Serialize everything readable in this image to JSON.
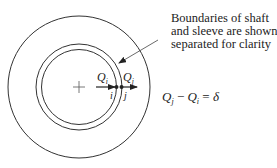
{
  "diagram": {
    "annotation": {
      "lines": [
        "Boundaries of shaft",
        "and sleeve are shown",
        "separated for clarity"
      ]
    },
    "labels": {
      "flow_in": {
        "symbol": "Q",
        "subscript": "i"
      },
      "flow_out": {
        "symbol": "Q",
        "subscript": "j"
      },
      "node_i": "i",
      "node_j": "j"
    },
    "equation": {
      "lhs_a_symbol": "Q",
      "lhs_a_sub": "j",
      "operator": " − ",
      "lhs_b_symbol": "Q",
      "lhs_b_sub": "i",
      "equals": " = ",
      "rhs": "δ"
    },
    "geometry": {
      "center": [
        79,
        87
      ],
      "outer_radius": 71,
      "sleeve_radius": 43,
      "shaft_radius": 37
    },
    "colors": {
      "stroke": "#333333",
      "background": "#ffffff"
    }
  }
}
